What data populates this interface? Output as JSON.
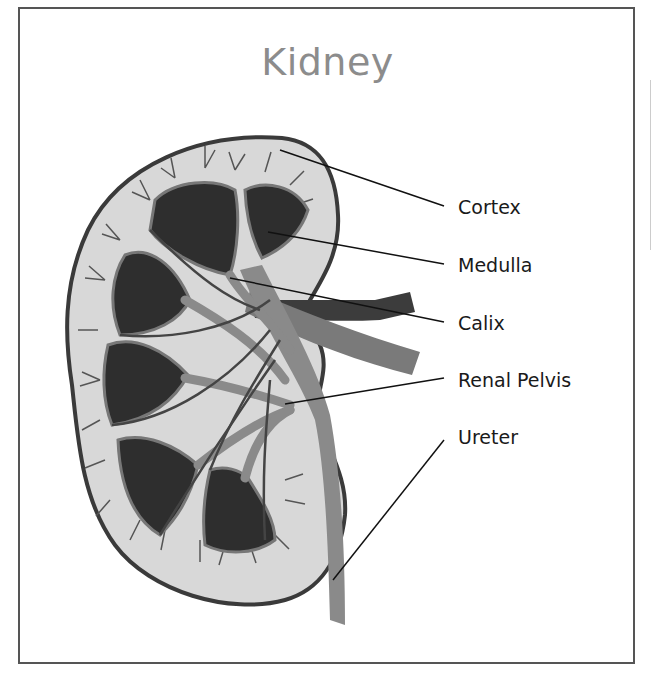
{
  "title": "Kidney",
  "labels": [
    {
      "id": "cortex",
      "text": "Cortex"
    },
    {
      "id": "medulla",
      "text": "Medulla"
    },
    {
      "id": "calix",
      "text": "Calix"
    },
    {
      "id": "renal-pelvis",
      "text": "Renal Pelvis"
    },
    {
      "id": "ureter",
      "text": "Ureter"
    }
  ],
  "colors": {
    "frame": "#555555",
    "title": "#8c8c8c",
    "cortex_fill": "#d8d8d8",
    "outline": "#3a3a3a",
    "medulla": "#2e2e2e",
    "vessel_light": "#8a8a8a",
    "vessel_dark": "#3c3c3c",
    "leader_line": "#111111"
  }
}
